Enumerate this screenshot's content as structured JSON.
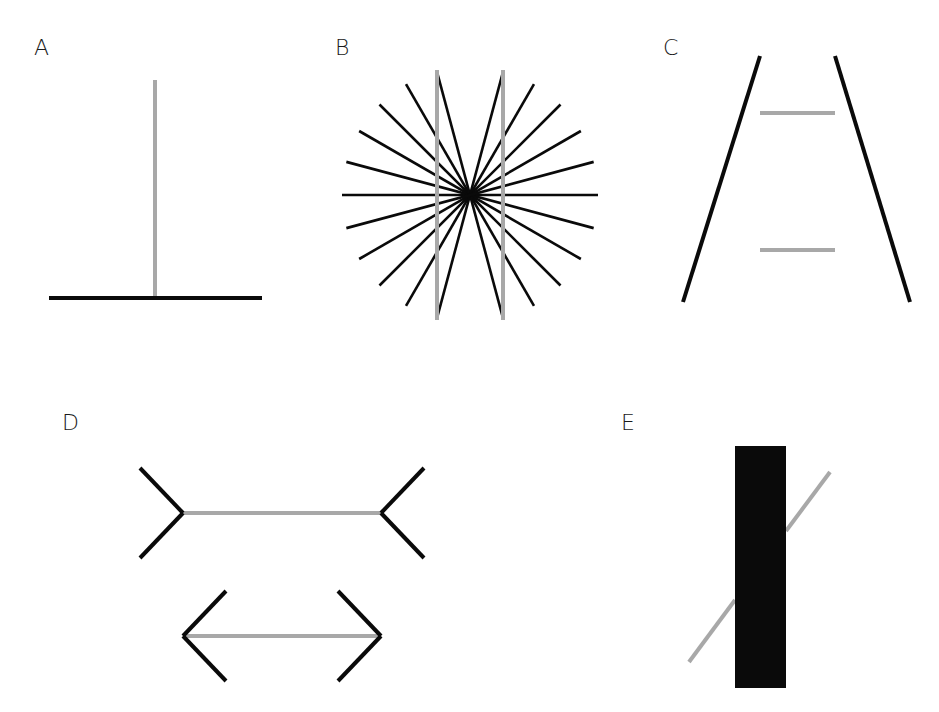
{
  "figure": {
    "colors": {
      "black": "#0a0a0a",
      "gray": "#a8a8a8",
      "background": "#ffffff"
    },
    "panels": [
      {
        "id": "A",
        "label": "A",
        "name": "Vertical-horizontal illusion",
        "horizontal": {
          "x1": 49,
          "y1": 298,
          "x2": 262,
          "y2": 298
        },
        "vertical": {
          "x1": 155,
          "y1": 80,
          "x2": 155,
          "y2": 296
        }
      },
      {
        "id": "B",
        "label": "B",
        "name": "Hering illusion",
        "center": {
          "x": 470,
          "y": 195
        },
        "radius": 128,
        "ray_angles_deg": [
          0,
          15,
          30,
          45,
          60,
          75,
          105,
          120,
          135,
          150,
          165
        ],
        "gray_lines": [
          {
            "x1": 437,
            "y1": 70,
            "x2": 437,
            "y2": 320
          },
          {
            "x1": 503,
            "y1": 70,
            "x2": 503,
            "y2": 320
          }
        ]
      },
      {
        "id": "C",
        "label": "C",
        "name": "Ponzo illusion",
        "black_lines": [
          {
            "x1": 760,
            "y1": 56,
            "x2": 683,
            "y2": 302
          },
          {
            "x1": 835,
            "y1": 56,
            "x2": 910,
            "y2": 302
          }
        ],
        "gray_lines": [
          {
            "x1": 760,
            "y1": 113,
            "x2": 835,
            "y2": 113
          },
          {
            "x1": 760,
            "y1": 250,
            "x2": 835,
            "y2": 250
          }
        ]
      },
      {
        "id": "D",
        "label": "D",
        "name": "Müller-Lyer illusion",
        "top": {
          "shaft": {
            "x1": 183,
            "y1": 513,
            "x2": 381,
            "y2": 513
          },
          "fin_dx": -43,
          "fin_dy": 45
        },
        "bottom": {
          "shaft": {
            "x1": 183,
            "y1": 636,
            "x2": 381,
            "y2": 636
          },
          "fin_dx": 43,
          "fin_dy": 45
        }
      },
      {
        "id": "E",
        "label": "E",
        "name": "Poggendorff illusion",
        "rect": {
          "x": 735,
          "y": 446,
          "width": 51,
          "height": 242
        },
        "gray_segments": [
          {
            "x1": 689,
            "y1": 662,
            "x2": 735,
            "y2": 600
          },
          {
            "x1": 786,
            "y1": 531,
            "x2": 830,
            "y2": 472
          }
        ]
      }
    ]
  }
}
